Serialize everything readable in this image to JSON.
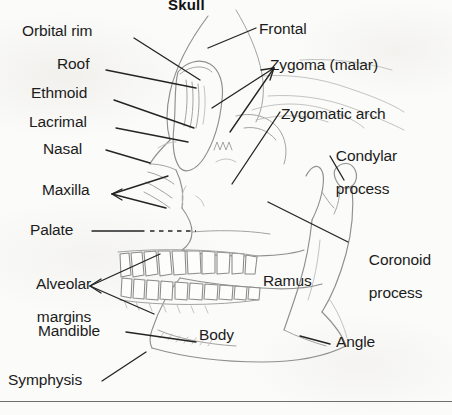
{
  "figure": {
    "title": "Skull",
    "title_clipped": true,
    "background_color": "#fbfbf9",
    "ink_color": "#1c1c1c",
    "drawing_color": "#8d8d8d",
    "width": 452,
    "height": 415
  },
  "labels": {
    "orbital_rim": "Orbital rim",
    "roof": "Roof",
    "ethmoid": "Ethmoid",
    "lacrimal": "Lacrimal",
    "nasal": "Nasal",
    "maxilla": "Maxilla",
    "palate": "Palate",
    "alveolar_line1": "Alveolar",
    "alveolar_line2": "margins",
    "mandible": "Mandible",
    "symphysis": "Symphysis",
    "frontal": "Frontal",
    "zygoma": "Zygoma (malar)",
    "zygomatic_arch": "Zygomatic arch",
    "condylar_line1": "Condylar",
    "condylar_line2": "process",
    "coronoid_line1": "Coronoid",
    "coronoid_line2": "process",
    "ramus": "Ramus",
    "body": "Body",
    "angle": "Angle"
  },
  "leader_lines": {
    "count": 14,
    "styles": [
      "solid",
      "forked",
      "dashed"
    ],
    "palate_style": "solid-then-dashed"
  },
  "footer_rule": {
    "present": true,
    "y": 401
  }
}
